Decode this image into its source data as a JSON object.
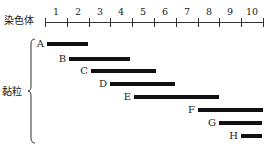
{
  "title": "",
  "axis": {
    "label": "染色体",
    "segments": [
      "1",
      "2",
      "3",
      "4",
      "5",
      "6",
      "7",
      "8",
      "9",
      "10"
    ]
  },
  "group_label": "黏粒",
  "clones": [
    {
      "name": "A",
      "start": 0.1,
      "end": 2.0
    },
    {
      "name": "B",
      "start": 1.1,
      "end": 3.9
    },
    {
      "name": "C",
      "start": 2.1,
      "end": 5.1
    },
    {
      "name": "D",
      "start": 3.0,
      "end": 6.0
    },
    {
      "name": "E",
      "start": 4.1,
      "end": 8.0
    },
    {
      "name": "F",
      "start": 7.0,
      "end": 10.0
    },
    {
      "name": "G",
      "start": 8.0,
      "end": 9.95
    },
    {
      "name": "H",
      "start": 9.0,
      "end": 9.95
    }
  ],
  "chart_data": {
    "type": "gantt-diagram",
    "title": "",
    "axis_label": "染色体",
    "axis_ticks": [
      "1",
      "2",
      "3",
      "4",
      "5",
      "6",
      "7",
      "8",
      "9",
      "10"
    ],
    "group_label": "黏粒",
    "series": [
      {
        "name": "A",
        "start": 0.1,
        "end": 2.0
      },
      {
        "name": "B",
        "start": 1.1,
        "end": 3.9
      },
      {
        "name": "C",
        "start": 2.1,
        "end": 5.1
      },
      {
        "name": "D",
        "start": 3.0,
        "end": 6.0
      },
      {
        "name": "E",
        "start": 4.1,
        "end": 8.0
      },
      {
        "name": "F",
        "start": 7.0,
        "end": 10.0
      },
      {
        "name": "G",
        "start": 8.0,
        "end": 9.95
      },
      {
        "name": "H",
        "start": 9.0,
        "end": 9.95
      }
    ],
    "xlim": [
      0,
      10
    ]
  }
}
